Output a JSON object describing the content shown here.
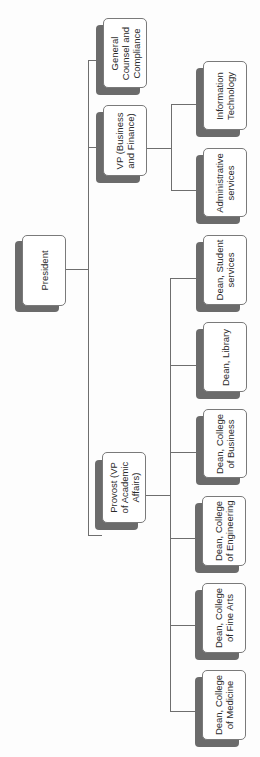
{
  "diagram": {
    "type": "org-chart",
    "orientation": "rotated-90-ccw",
    "colors": {
      "box_fill": "#ffffff",
      "box_border": "#7a7a7a",
      "shadow": "#6b6b6b",
      "connector": "#6e6e6e",
      "text": "#2a2a2a"
    },
    "root": {
      "label": "President",
      "children": [
        {
          "label": "General\nCounsel and\nCompliance"
        },
        {
          "label": "VP (Business\nand Finance)",
          "children": [
            {
              "label": "Information\nTechnology"
            },
            {
              "label": "Administrative\nservices"
            }
          ]
        },
        {
          "label": "Provost (VP\nof Academic\nAffairs)",
          "children": [
            {
              "label": "Dean, Student\nservices"
            },
            {
              "label": "Dean, Library"
            },
            {
              "label": "Dean, College\nof Business"
            },
            {
              "label": "Dean, College\nof Engineering"
            },
            {
              "label": "Dean, College\nof Fine Arts"
            },
            {
              "label": "Dean, College\nof Medicine"
            }
          ]
        }
      ]
    }
  }
}
